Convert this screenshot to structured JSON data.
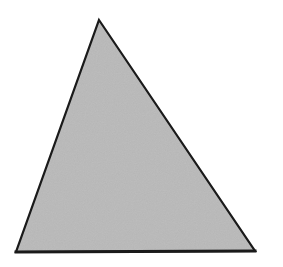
{
  "canvas": {
    "width": 283,
    "height": 267,
    "background_color": "#ffffff",
    "alt_text": "Gray shaded triangle on white background"
  },
  "figure": {
    "shape_name": "triangle",
    "fill_color": "#b9b9b9",
    "stroke_color": "#1a1a1a",
    "stroke_width": 2.2,
    "base_stroke_width": 3.0,
    "texture": "subtle-noise",
    "vertices": [
      {
        "label": "apex",
        "x": 99,
        "y": 20
      },
      {
        "label": "bottom-right",
        "x": 255,
        "y": 251
      },
      {
        "label": "bottom-left",
        "x": 16,
        "y": 252
      }
    ],
    "points_attr": "99,20 255,251 16,252",
    "base_line": {
      "x1": 16,
      "y1": 252,
      "x2": 255,
      "y2": 251
    }
  },
  "chart_data": {
    "type": "scatter",
    "xlabel": "",
    "ylabel": "",
    "x": [
      99,
      255,
      16
    ],
    "y": [
      20,
      251,
      252
    ],
    "categories": [
      "apex",
      "bottom-right",
      "bottom-left"
    ],
    "xlim": [
      0,
      283
    ],
    "ylim": [
      0,
      267
    ],
    "grid": false,
    "legend": "none"
  }
}
